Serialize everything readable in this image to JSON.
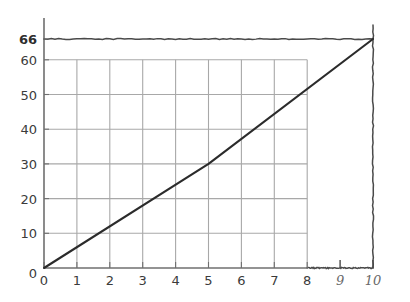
{
  "chart_data": {
    "type": "line",
    "title": "",
    "subtitle": "",
    "xlabel": "",
    "ylabel": "",
    "xlim": [
      0,
      10
    ],
    "ylim": [
      0,
      66
    ],
    "grid": true,
    "legend": null,
    "legend_position": "none",
    "x": [
      0,
      10
    ],
    "values": [
      0,
      66
    ],
    "series": [
      {
        "name": "line",
        "x": [
          0,
          5,
          10
        ],
        "values": [
          0,
          30,
          66
        ]
      }
    ],
    "x_tick_labels": [
      "0",
      "1",
      "2",
      "3",
      "4",
      "5",
      "6",
      "7",
      "8",
      "9",
      "10"
    ],
    "x_tick_values": [
      0,
      1,
      2,
      3,
      4,
      5,
      6,
      7,
      8,
      9,
      10
    ],
    "y_tick_labels": [
      "0",
      "10",
      "20",
      "30",
      "40",
      "50",
      "60",
      "66"
    ],
    "y_tick_values": [
      0,
      10,
      20,
      30,
      40,
      50,
      60,
      66
    ],
    "printed_grid_xmax": 8,
    "printed_grid_ymax": 60,
    "annotations": [
      {
        "name": "horizontal-line-66",
        "type": "hline",
        "y": 66,
        "x_from": 0,
        "x_to": 10,
        "label": "66"
      },
      {
        "name": "vertical-line-10",
        "type": "vline",
        "x": 10,
        "y_from": 0,
        "y_to": 70,
        "label": "10"
      },
      {
        "name": "axis-extension",
        "type": "hline",
        "y": 0,
        "x_from": 8,
        "x_to": 10,
        "label": ""
      },
      {
        "name": "tick-9",
        "type": "tick",
        "x": 9,
        "label": "9"
      },
      {
        "name": "tick-10",
        "type": "tick",
        "x": 10,
        "label": "10"
      }
    ]
  },
  "axis": {
    "x_ticks": [
      {
        "value": 0,
        "label": "0",
        "style": "printed"
      },
      {
        "value": 1,
        "label": "1",
        "style": "printed"
      },
      {
        "value": 2,
        "label": "2",
        "style": "printed"
      },
      {
        "value": 3,
        "label": "3",
        "style": "printed"
      },
      {
        "value": 4,
        "label": "4",
        "style": "printed"
      },
      {
        "value": 5,
        "label": "5",
        "style": "printed"
      },
      {
        "value": 6,
        "label": "6",
        "style": "printed"
      },
      {
        "value": 7,
        "label": "7",
        "style": "printed"
      },
      {
        "value": 8,
        "label": "8",
        "style": "printed"
      },
      {
        "value": 9,
        "label": "9",
        "style": "hand"
      },
      {
        "value": 10,
        "label": "10",
        "style": "hand"
      }
    ],
    "y_ticks": [
      {
        "value": 0,
        "label": "0",
        "style": "printed"
      },
      {
        "value": 10,
        "label": "10",
        "style": "printed"
      },
      {
        "value": 20,
        "label": "20",
        "style": "printed"
      },
      {
        "value": 30,
        "label": "30",
        "style": "printed"
      },
      {
        "value": 40,
        "label": "40",
        "style": "printed"
      },
      {
        "value": 50,
        "label": "50",
        "style": "printed"
      },
      {
        "value": 60,
        "label": "60",
        "style": "printed"
      },
      {
        "value": 66,
        "label": "66",
        "style": "annot"
      }
    ]
  },
  "colors": {
    "background": "#ffffff",
    "grid": "#a8a8a8",
    "axis": "#6f6f6f",
    "data_line": "#2b2b2b",
    "annotation_line": "#4a4a4a",
    "printed_label": "#3b3b3b",
    "hand_label": "#6a6a6a",
    "annot_label": "#2e2e2e"
  }
}
